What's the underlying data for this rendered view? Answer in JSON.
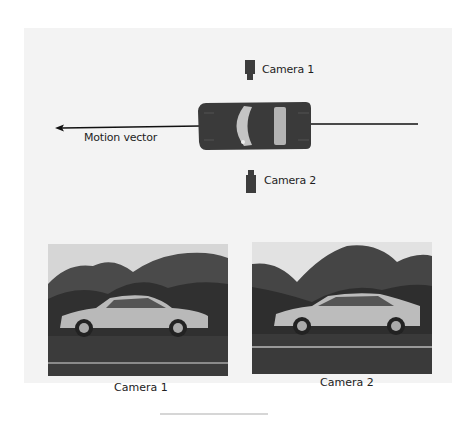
{
  "diagram": {
    "top_view": {
      "camera_1_label": "Camera 1",
      "camera_2_label": "Camera 2",
      "motion_label": "Motion vector",
      "arrow_direction": "left",
      "colors": {
        "car_body": "#3a3a3a",
        "car_glass": "#b8b8b8",
        "camera": "#3c3c3c",
        "arrow": "#111111",
        "panel_bg": "#f3f3f3"
      }
    },
    "photos": [
      {
        "caption": "Camera 1",
        "car_facing": "right"
      },
      {
        "caption": "Camera 2",
        "car_facing": "left"
      }
    ]
  }
}
